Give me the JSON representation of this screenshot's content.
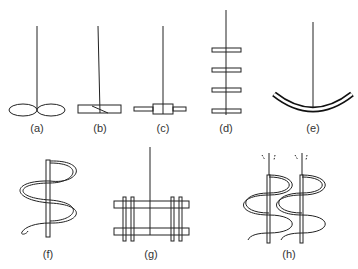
{
  "figure": {
    "panels": [
      {
        "id": "a",
        "label": "(a)",
        "name": "propeller"
      },
      {
        "id": "b",
        "label": "(b)",
        "name": "pitched-blade-paddle"
      },
      {
        "id": "c",
        "label": "(c)",
        "name": "flat-blade-turbine"
      },
      {
        "id": "d",
        "label": "(d)",
        "name": "multi-stage-paddle"
      },
      {
        "id": "e",
        "label": "(e)",
        "name": "anchor"
      },
      {
        "id": "f",
        "label": "(f)",
        "name": "helical-ribbon"
      },
      {
        "id": "g",
        "label": "(g)",
        "name": "gate"
      },
      {
        "id": "h",
        "label": "(h)",
        "name": "double-helical-ribbon"
      }
    ],
    "colors": {
      "stroke": "#222222",
      "background": "#ffffff"
    }
  }
}
